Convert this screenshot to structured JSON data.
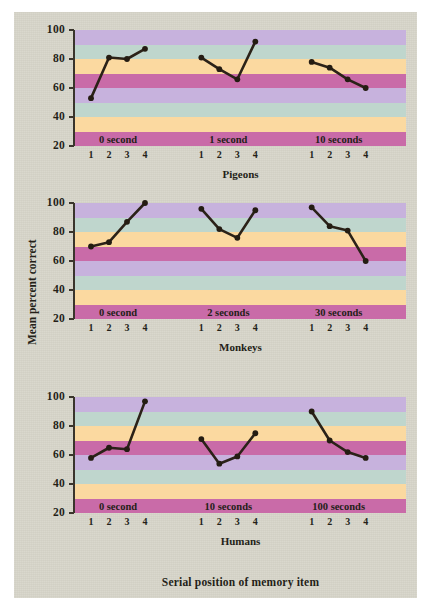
{
  "figure": {
    "background_color": "#d6d4c8",
    "outer_background": "#ffffff",
    "axis_color": "#3a352c",
    "line_color": "#2b2218",
    "marker_color": "#241c12",
    "band_colors": [
      "#c7b2dd",
      "#bfd6cd",
      "#fbd9a0",
      "#c96ba8"
    ],
    "x_axis_label": "Serial position of memory item",
    "y_axis_label": "Mean percent correct"
  },
  "chart_data": {
    "type": "line",
    "title": "",
    "xlabel": "Serial position of memory item",
    "ylabel": "Mean percent correct",
    "ylim": [
      20,
      100
    ],
    "yticks": [
      20,
      40,
      60,
      80,
      100
    ],
    "ytick_labels": [
      "20",
      "40",
      "60",
      "80",
      "100"
    ],
    "x": [
      1,
      2,
      3,
      4
    ],
    "xtick_labels": [
      "1",
      "2",
      "3",
      "4"
    ],
    "grid": false,
    "legend": "none",
    "banded_background": true,
    "band_height": 10,
    "panels": [
      {
        "name": "Pigeons",
        "groups": [
          {
            "label": "0 second",
            "values": [
              53,
              81,
              80,
              87
            ]
          },
          {
            "label": "1 second",
            "values": [
              81,
              73,
              66,
              92
            ]
          },
          {
            "label": "10 seconds",
            "values": [
              78,
              74,
              66,
              60
            ]
          }
        ]
      },
      {
        "name": "Monkeys",
        "groups": [
          {
            "label": "0 second",
            "values": [
              70,
              73,
              87,
              100
            ]
          },
          {
            "label": "2 seconds",
            "values": [
              96,
              82,
              76,
              95
            ]
          },
          {
            "label": "30 seconds",
            "values": [
              97,
              84,
              81,
              60
            ]
          }
        ]
      },
      {
        "name": "Humans",
        "groups": [
          {
            "label": "0 second",
            "values": [
              58,
              65,
              64,
              97
            ]
          },
          {
            "label": "10 seconds",
            "values": [
              71,
              54,
              59,
              75
            ]
          },
          {
            "label": "100 seconds",
            "values": [
              90,
              70,
              62,
              58
            ]
          }
        ]
      }
    ]
  }
}
